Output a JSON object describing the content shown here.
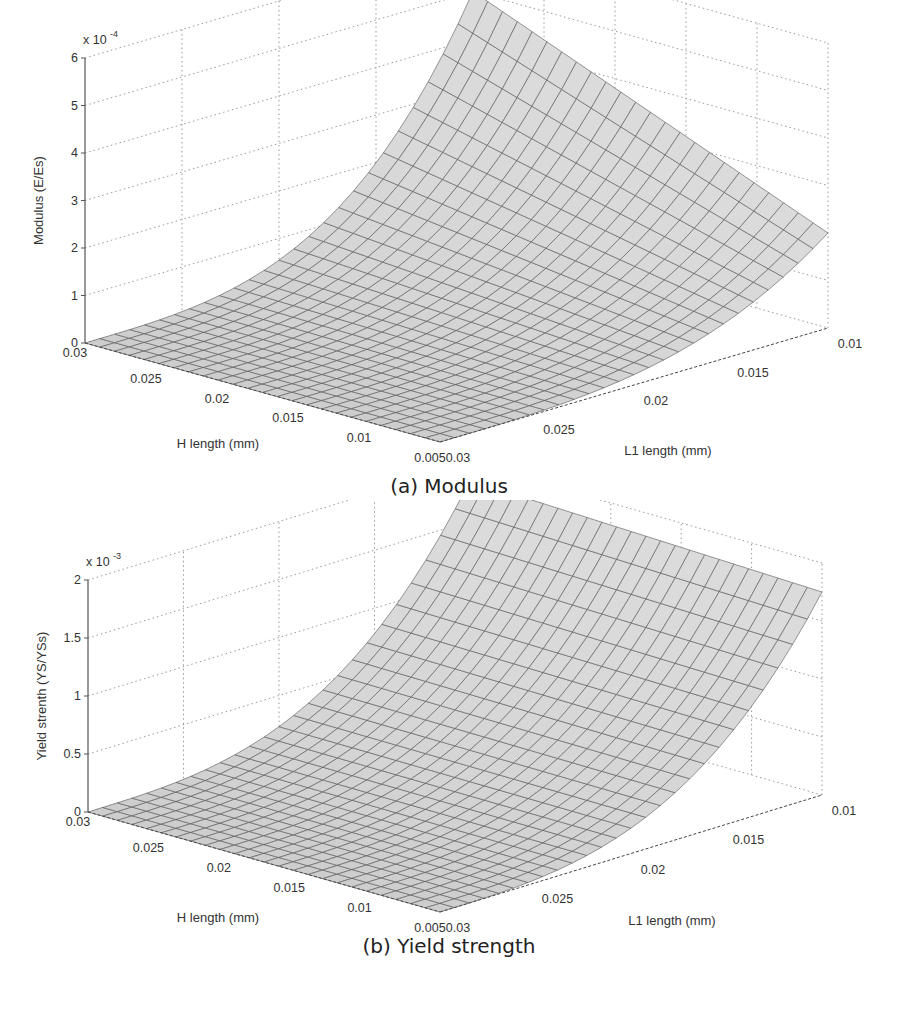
{
  "figure": {
    "panels": [
      {
        "id": "a",
        "caption": "(a) Modulus"
      },
      {
        "id": "b",
        "caption": "(b) Yield strength"
      }
    ]
  },
  "chart_data": [
    {
      "type": "surface",
      "title": "(a) Modulus",
      "zlabel": "Modulus (E/Es)",
      "zscale": "x 10",
      "zscale_exp": "-4",
      "xlabel": "H length (mm)",
      "ylabel": "L1 length (mm)",
      "z_ticks": [
        "0",
        "1",
        "2",
        "3",
        "4",
        "5",
        "6"
      ],
      "x_ticks": [
        "0.03",
        "0.025",
        "0.02",
        "0.015",
        "0.01",
        "0.005"
      ],
      "y_ticks": [
        "0.03",
        "0.025",
        "0.02",
        "0.015",
        "0.01"
      ],
      "xlim": [
        0.005,
        0.03
      ],
      "ylim": [
        0.01,
        0.03
      ],
      "zlim": [
        0,
        0.0006
      ],
      "grid": true,
      "colormap": "gray",
      "corner_values": {
        "H0.03_L0.03": 0.0,
        "H0.005_L0.03": 0.0,
        "H0.03_L0.01": 0.0005,
        "H0.005_L0.01": 0.0002
      }
    },
    {
      "type": "surface",
      "title": "(b) Yield strength",
      "zlabel": "Yield strenth (YS/YSs)",
      "zscale": "x 10",
      "zscale_exp": "-3",
      "xlabel": "H length (mm)",
      "ylabel": "L1 length (mm)",
      "z_ticks": [
        "0",
        "0.5",
        "1",
        "1.5",
        "2"
      ],
      "x_ticks": [
        "0.03",
        "0.025",
        "0.02",
        "0.015",
        "0.01",
        "0.005"
      ],
      "y_ticks": [
        "0.03",
        "0.025",
        "0.02",
        "0.015",
        "0.01"
      ],
      "xlim": [
        0.005,
        0.03
      ],
      "ylim": [
        0.01,
        0.03
      ],
      "zlim": [
        0,
        0.002
      ],
      "grid": true,
      "colormap": "gray",
      "corner_values": {
        "H0.03_L0.03": 0.0,
        "H0.005_L0.03": 0.0,
        "H0.03_L0.01": 0.00185,
        "H0.005_L0.01": 0.00175
      }
    }
  ]
}
